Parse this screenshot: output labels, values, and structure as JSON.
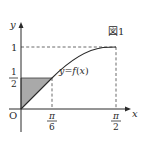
{
  "figure": {
    "caption": "図1",
    "curve_label": "y = f(x)",
    "curve_label_parts": {
      "y": "y",
      "eq": "=",
      "f": "f",
      "open": "(",
      "x": "x",
      "close": ")"
    },
    "origin_label": "O",
    "axes": {
      "x_label": "x",
      "y_label": "y"
    },
    "x_ticks": [
      {
        "num": "π",
        "den": "6",
        "value": "π/6"
      },
      {
        "num": "π",
        "den": "2",
        "value": "π/2"
      }
    ],
    "y_ticks": [
      {
        "label": "1",
        "value": 1
      },
      {
        "num": "1",
        "den": "2",
        "value": 0.5
      }
    ],
    "shaded_region": "triangle O–(0, 1/2)–(π/6, 1/2)",
    "colors": {
      "line": "#2a2a2a",
      "shade": "#a9a9a9",
      "dash": "#444444"
    }
  }
}
